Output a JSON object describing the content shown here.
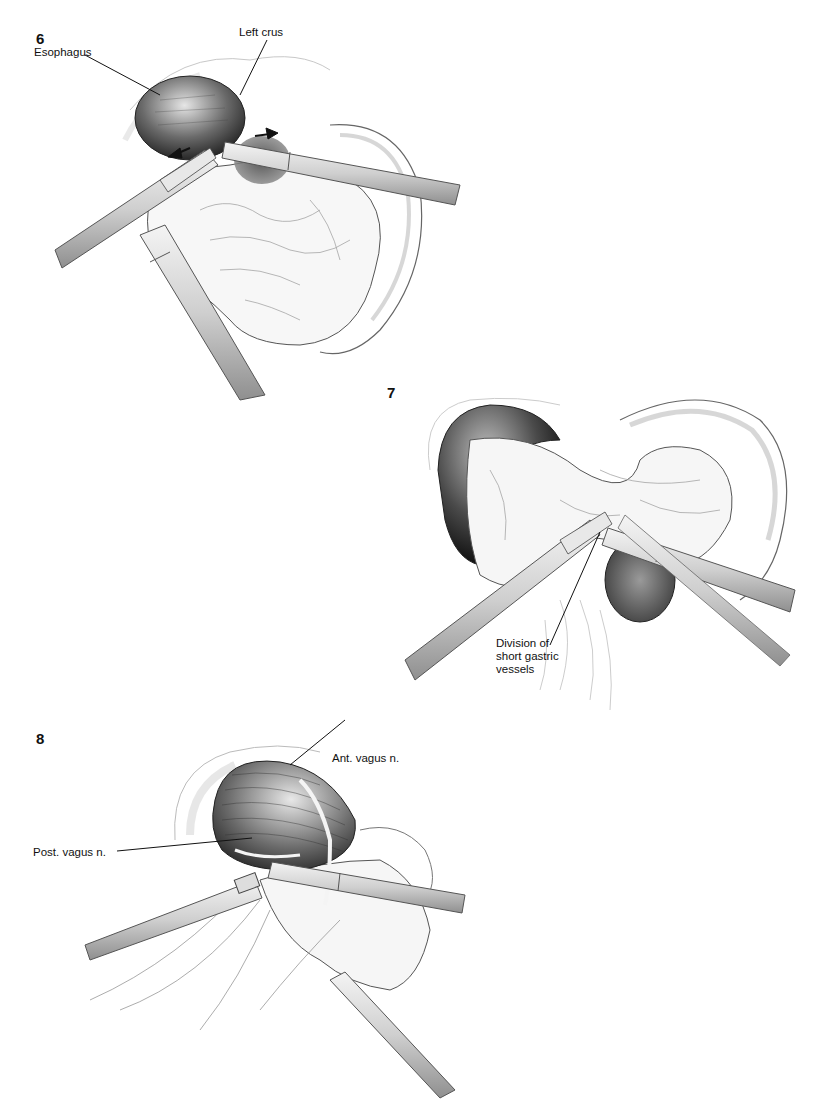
{
  "figures": [
    {
      "number": "6",
      "labels": {
        "esophagus": "Esophagus",
        "left_crus": "Left crus"
      }
    },
    {
      "number": "7",
      "labels": {
        "division": "Division of short gastric vessels"
      }
    },
    {
      "number": "8",
      "labels": {
        "ant_vagus": "Ant. vagus n.",
        "post_vagus": "Post. vagus n."
      }
    }
  ],
  "colors": {
    "ink": "#111111",
    "shade_dark": "#2b2b2b",
    "shade_mid": "#8a8a8a",
    "shade_light": "#d9d9d9",
    "paper": "#ffffff"
  }
}
